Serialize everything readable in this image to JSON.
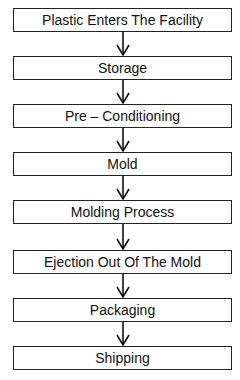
{
  "flowchart": {
    "direction": "top-to-bottom",
    "colors": {
      "border": "#222222",
      "text": "#111111",
      "background": "#ffffff"
    },
    "steps": [
      {
        "label": "Plastic Enters The Facility"
      },
      {
        "label": "Storage"
      },
      {
        "label": "Pre – Conditioning"
      },
      {
        "label": "Mold"
      },
      {
        "label": "Molding Process"
      },
      {
        "label": "Ejection Out Of The Mold"
      },
      {
        "label": "Packaging"
      },
      {
        "label": "Shipping"
      }
    ]
  }
}
